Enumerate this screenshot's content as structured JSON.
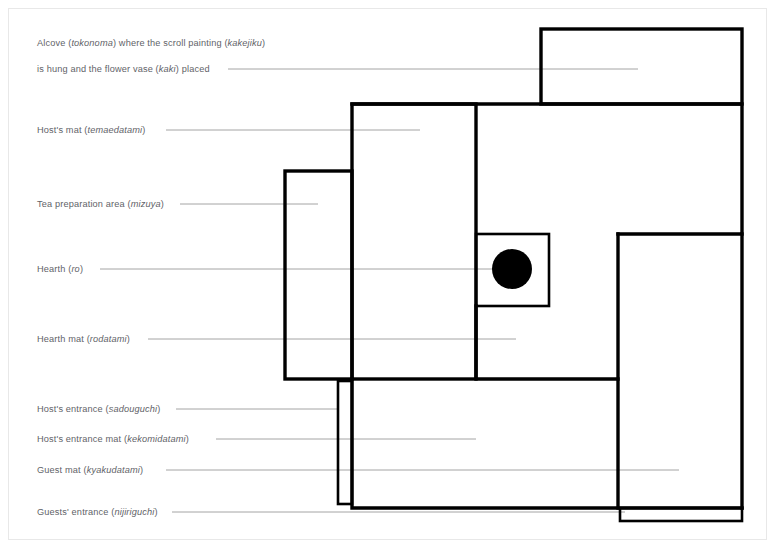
{
  "diagram": {
    "colors": {
      "wall": "#000000",
      "leader": "#9a9a9a",
      "label": "#5f6368",
      "hearth": "#000000",
      "background": "#ffffff",
      "page_border": "#e8e8e8"
    }
  },
  "labels": [
    {
      "id": "tokonoma",
      "line1_pre": "Alcove (",
      "line1_term": "tokonoma",
      "line1_mid": ") where the scroll painting (",
      "line1_term2": "kakejiku",
      "line1_post": ")",
      "line2_pre": "is hung and the flower vase (",
      "line2_term": "kaki",
      "line2_post": ") placed",
      "text_full": "Alcove (tokonoma) where the scroll painting (kakejiku) is hung and the flower vase (kaki) placed"
    },
    {
      "id": "temaedatami",
      "pre": "Host's mat (",
      "term": "temaedatami",
      "post": ")",
      "text_full": "Host's mat (temaedatami)"
    },
    {
      "id": "mizuya",
      "pre": "Tea preparation area (",
      "term": "mizuya",
      "post": ")",
      "text_full": "Tea preparation area (mizuya)"
    },
    {
      "id": "ro",
      "pre": "Hearth (",
      "term": "ro",
      "post": ")",
      "text_full": "Hearth (ro)"
    },
    {
      "id": "rodatami",
      "pre": "Hearth mat (",
      "term": "rodatami",
      "post": ")",
      "text_full": "Hearth mat (rodatami)"
    },
    {
      "id": "sadouguchi",
      "pre": "Host's entrance (",
      "term": "sadouguchi",
      "post": ")",
      "text_full": "Host's entrance (sadouguchi)"
    },
    {
      "id": "kekomidatami",
      "pre": "Host's entrance mat (",
      "term": "kekomidatami",
      "post": ")",
      "text_full": "Host's entrance mat (kekomidatami)"
    },
    {
      "id": "kyakudatami",
      "pre": "Guest mat (",
      "term": "kyakudatami",
      "post": ")",
      "text_full": "Guest mat (kyakudatami)"
    },
    {
      "id": "nijiriguchi",
      "pre": "Guests' entrance (",
      "term": "nijiriguchi",
      "post": ")",
      "text_full": "Guests' entrance (nijiriguchi)"
    }
  ]
}
